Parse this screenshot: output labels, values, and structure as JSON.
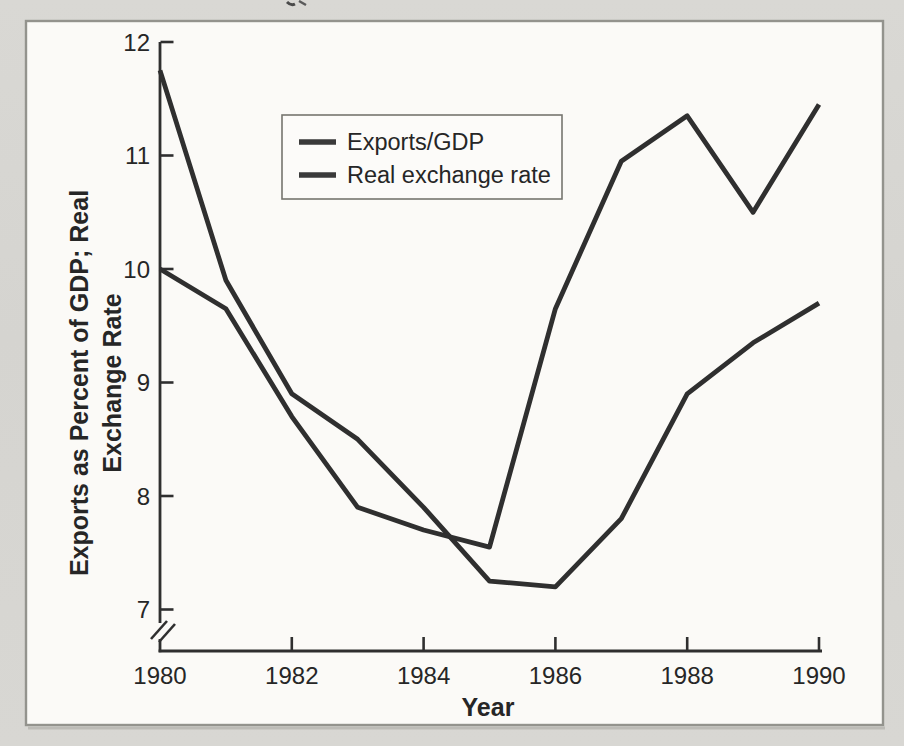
{
  "figure": {
    "page_background": "#d7d6d2",
    "panel_background": "#fbfaf7",
    "panel_border_color": "#93938d",
    "line_color": "#2f2f2f",
    "text_color": "#262626"
  },
  "legend": {
    "items": [
      {
        "label": "Exports/GDP"
      },
      {
        "label": "Real exchange rate"
      }
    ]
  },
  "axes": {
    "x_label": "Year",
    "y_label_line1": "Exports as Percent of GDP; Real",
    "y_label_line2": "Exchange Rate"
  },
  "chart_data": {
    "type": "line",
    "title": "",
    "xlabel": "Year",
    "ylabel": "Exports as Percent of GDP; Real Exchange Rate",
    "x": [
      1980,
      1981,
      1982,
      1983,
      1984,
      1985,
      1986,
      1987,
      1988,
      1989,
      1990
    ],
    "series": [
      {
        "name": "Exports/GDP",
        "values": [
          11.75,
          9.9,
          8.9,
          8.5,
          7.9,
          7.25,
          7.2,
          7.8,
          8.9,
          9.35,
          9.7
        ]
      },
      {
        "name": "Real exchange rate",
        "values": [
          10.0,
          9.65,
          8.7,
          7.9,
          7.7,
          7.55,
          9.65,
          10.95,
          11.35,
          10.5,
          11.45
        ]
      }
    ],
    "x_ticks": [
      1980,
      1982,
      1984,
      1986,
      1988,
      1990
    ],
    "x_ticklabels": [
      "1980",
      "1982",
      "1984",
      "1986",
      "1988",
      "1990"
    ],
    "y_ticks": [
      12,
      11,
      10,
      9,
      8,
      7
    ],
    "y_ticklabels": [
      "12",
      "11",
      "10",
      "9",
      "8",
      "7"
    ],
    "xlim": [
      1980,
      1990
    ],
    "ylim": [
      7,
      12
    ],
    "axis_break": true,
    "grid": false,
    "legend_position": "upper-left-inside"
  }
}
